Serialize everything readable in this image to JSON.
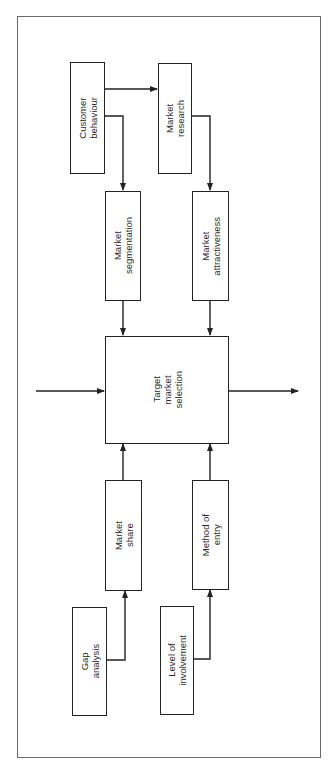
{
  "diagram": {
    "orientation": "rotated-90-ccw",
    "nodes": [
      {
        "id": "customer_behaviour",
        "label": "Customer\nbehaviour"
      },
      {
        "id": "market_research",
        "label": "Market\nresearch"
      },
      {
        "id": "market_segmentation",
        "label": "Market\nsegmentation"
      },
      {
        "id": "market_attractiveness",
        "label": "Market\nattractiveness"
      },
      {
        "id": "target_market_selection",
        "label": "Target\nmarket\nselection"
      },
      {
        "id": "market_share",
        "label": "Market\nshare"
      },
      {
        "id": "method_of_entry",
        "label": "Method of\nentry"
      },
      {
        "id": "gap_analysis",
        "label": "Gap\nanalysis"
      },
      {
        "id": "level_of_involvement",
        "label": "Level of\ninvolvement"
      }
    ],
    "edges": [
      {
        "from": "customer_behaviour",
        "to": "market_research"
      },
      {
        "from": "customer_behaviour",
        "to": "market_segmentation"
      },
      {
        "from": "market_research",
        "to": "market_attractiveness"
      },
      {
        "from": "market_segmentation",
        "to": "target_market_selection"
      },
      {
        "from": "market_attractiveness",
        "to": "target_market_selection"
      },
      {
        "from": "market_share",
        "to": "target_market_selection"
      },
      {
        "from": "method_of_entry",
        "to": "target_market_selection"
      },
      {
        "from": "gap_analysis",
        "to": "market_share"
      },
      {
        "from": "level_of_involvement",
        "to": "method_of_entry"
      },
      {
        "from": "input",
        "to": "target_market_selection"
      },
      {
        "from": "target_market_selection",
        "to": "output"
      }
    ]
  },
  "colors": {
    "line": "#222222",
    "frame": "#6a6a6a",
    "background": "#ffffff"
  }
}
